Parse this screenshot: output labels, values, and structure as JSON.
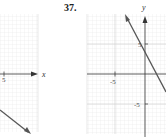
{
  "problem_number": "37.",
  "left_graph": {
    "x_axis_label": "x",
    "x_tick_label": "5",
    "line_color": "#555555"
  },
  "right_graph": {
    "x_axis_label": "x",
    "y_axis_label": "y",
    "x_tick_label": "-5",
    "y_tick_label_top": "5",
    "y_tick_label_bottom": "-5",
    "line_color": "#555555"
  },
  "colors": {
    "grid_minor": "#e6e6e6",
    "grid_major": "#cfcfcf",
    "axis": "#333333"
  }
}
